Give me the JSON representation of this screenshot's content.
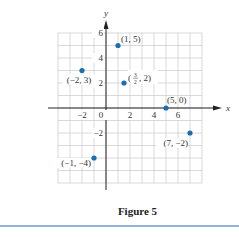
{
  "chart_data": {
    "type": "scatter",
    "title": "",
    "caption": "Figure 5",
    "xlabel": "x",
    "ylabel": "y",
    "xlim": [
      -4,
      8
    ],
    "ylim": [
      -6,
      6
    ],
    "grid": true,
    "grid_step": 1,
    "x_ticks": [
      -2,
      0,
      2,
      4,
      6
    ],
    "y_ticks": [
      6,
      4,
      2,
      -2
    ],
    "x_tick_labels": [
      "−2",
      "0",
      "2",
      "4",
      "6"
    ],
    "y_tick_labels": [
      "6",
      "4",
      "2",
      "−2"
    ],
    "points": [
      {
        "x": 1,
        "y": 5,
        "label": "(1, 5)"
      },
      {
        "x": -2,
        "y": 3,
        "label": "(−2, 3)"
      },
      {
        "x": 1.5,
        "y": 2,
        "label": "(3/2, 2)"
      },
      {
        "x": 5,
        "y": 0,
        "label": "(5, 0)"
      },
      {
        "x": 7,
        "y": -2,
        "label": "(7, −2)"
      },
      {
        "x": -1,
        "y": -4,
        "label": "(−1, −4)"
      }
    ],
    "colors": {
      "point": "#1a6fb0",
      "grid": "#cfcfcf",
      "axis": "#222222",
      "rule": "#8fb4d6"
    }
  },
  "figure": {
    "caption": "Figure 5"
  }
}
